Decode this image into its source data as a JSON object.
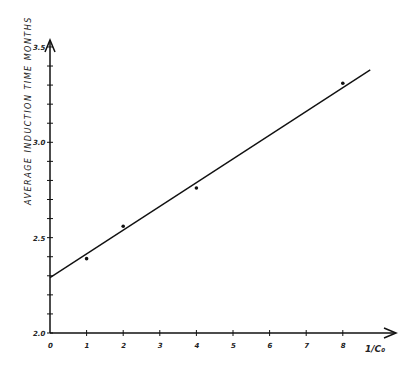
{
  "chart_data": {
    "type": "scatter",
    "title": "",
    "xlabel": "1/C0",
    "ylabel": "AVERAGE INDUCTION TIME MONTHS",
    "xlim": [
      0,
      9
    ],
    "ylim": [
      2.0,
      3.5
    ],
    "x_ticks": [
      "0",
      "1",
      "2",
      "3",
      "4",
      "5",
      "6",
      "7",
      "8"
    ],
    "y_ticks": [
      "2.0",
      "2.5",
      "3.0",
      "3.5"
    ],
    "grid": false,
    "points": {
      "x": [
        1,
        2,
        4,
        8
      ],
      "y": [
        2.39,
        2.56,
        2.76,
        3.31
      ]
    },
    "fit_line": {
      "x": [
        0,
        8.75
      ],
      "y": [
        2.29,
        3.38
      ]
    }
  },
  "labels": {
    "ylabel": "AVERAGE INDUCTION TIME MONTHS",
    "xlabel": "1/C₀",
    "y_ticks": [
      "2.0",
      "2.5",
      "3.0",
      "3.5"
    ],
    "x_ticks": [
      "0",
      "1",
      "2",
      "3",
      "4",
      "5",
      "6",
      "7",
      "8"
    ]
  }
}
